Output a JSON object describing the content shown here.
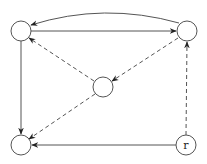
{
  "diagram": {
    "type": "directed-graph",
    "nodes": [
      {
        "id": "tl",
        "label": "",
        "x": 21,
        "y": 31
      },
      {
        "id": "tr",
        "label": "",
        "x": 187,
        "y": 31
      },
      {
        "id": "c",
        "label": "",
        "x": 103,
        "y": 87
      },
      {
        "id": "bl",
        "label": "",
        "x": 21,
        "y": 145
      },
      {
        "id": "r",
        "label": "r",
        "x": 186,
        "y": 145
      }
    ],
    "edges": [
      {
        "from": "tr",
        "to": "tl",
        "style": "solid",
        "curved": true
      },
      {
        "from": "tl",
        "to": "tr",
        "style": "solid"
      },
      {
        "from": "tl",
        "to": "bl",
        "style": "solid"
      },
      {
        "from": "r",
        "to": "bl",
        "style": "solid"
      },
      {
        "from": "r",
        "to": "tr",
        "style": "dashed"
      },
      {
        "from": "tr",
        "to": "c",
        "style": "dashed"
      },
      {
        "from": "c",
        "to": "tl",
        "style": "dashed"
      },
      {
        "from": "c",
        "to": "bl",
        "style": "dashed"
      }
    ]
  }
}
